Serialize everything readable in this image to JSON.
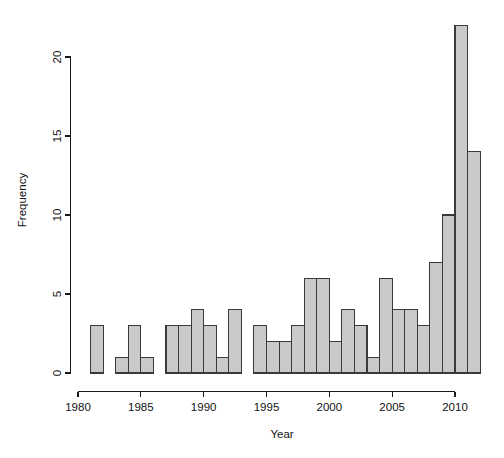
{
  "figure": {
    "background": "#ffffff",
    "bar_fill": "#c9c9c9",
    "bar_stroke": "#3a3a3a",
    "axis_color": "#1a1a1a"
  },
  "chart_data": {
    "type": "bar",
    "title": "",
    "subtitle": "",
    "xlabel": "Year",
    "ylabel": "Frequency",
    "xlim": [
      1980,
      2013
    ],
    "ylim": [
      0,
      22.5
    ],
    "grid": false,
    "legend": null,
    "bin_width": 1,
    "x_ticks": [
      1980,
      1985,
      1990,
      1995,
      2000,
      2005,
      2010
    ],
    "x_tick_labels": [
      "1980",
      "1985",
      "1990",
      "1995",
      "2000",
      "2005",
      "2010"
    ],
    "y_ticks": [
      0,
      5,
      10,
      15,
      20
    ],
    "y_tick_labels": [
      "0",
      "5",
      "10",
      "15",
      "20"
    ],
    "axis_range_drawn": {
      "x_axis_from": 1980,
      "x_axis_to": 2010,
      "y_axis_from": 0,
      "y_axis_to": 20
    },
    "categories": [
      "1981",
      "1982",
      "1983",
      "1984",
      "1985",
      "1986",
      "1987",
      "1988",
      "1989",
      "1990",
      "1991",
      "1992",
      "1993",
      "1994",
      "1995",
      "1996",
      "1997",
      "1998",
      "1999",
      "2000",
      "2001",
      "2002",
      "2003",
      "2004",
      "2005",
      "2006",
      "2007",
      "2008",
      "2009",
      "2010",
      "2011"
    ],
    "values": [
      3,
      0,
      1,
      3,
      1,
      0,
      3,
      3,
      4,
      3,
      1,
      4,
      0,
      3,
      2,
      2,
      3,
      6,
      6,
      2,
      4,
      3,
      1,
      6,
      4,
      4,
      3,
      7,
      10,
      22,
      14
    ],
    "max_value": 22,
    "min_value": 0,
    "total_count": 122
  }
}
